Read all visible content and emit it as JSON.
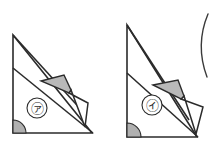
{
  "figure": {
    "background_color": "#ffffff",
    "stroke_color": "#2b2b2b",
    "shade_color": "#b9b9b9",
    "angle_mark_color": "#b0b0b0",
    "width": 212,
    "height": 144,
    "panels": [
      {
        "id": "panel-a",
        "label": "㋐",
        "label_position": {
          "x": 37,
          "y": 108
        },
        "label_radius": 10,
        "triangle": {
          "apex": {
            "x": 13,
            "y": 35
          },
          "bottom_left": {
            "x": 13,
            "y": 133
          },
          "bottom_right": {
            "x": 92,
            "y": 133
          }
        },
        "fold_crease": {
          "x1": 13,
          "y1": 68,
          "x2": 92,
          "y2": 133
        },
        "fold_lines": [
          {
            "x1": 13,
            "y1": 35,
            "x2": 86,
            "y2": 115
          },
          {
            "x1": 13,
            "y1": 68,
            "x2": 93,
            "y2": 133
          }
        ],
        "shaded_flap": [
          {
            "x": 41,
            "y": 81
          },
          {
            "x": 64,
            "y": 75
          },
          {
            "x": 71,
            "y": 90
          },
          {
            "x": 69,
            "y": 93
          }
        ],
        "white_flap": [
          {
            "x": 69,
            "y": 93
          },
          {
            "x": 88,
            "y": 103
          },
          {
            "x": 85,
            "y": 127
          },
          {
            "x": 71,
            "y": 90
          }
        ],
        "right_angle_marker": {
          "corner": {
            "x": 13,
            "y": 133
          },
          "radius": 13
        }
      },
      {
        "id": "panel-b",
        "label": "㋑",
        "label_position": {
          "x": 152,
          "y": 105
        },
        "label_radius": 10,
        "triangle": {
          "apex": {
            "x": 127,
            "y": 25
          },
          "bottom_left": {
            "x": 127,
            "y": 137
          },
          "bottom_right": {
            "x": 197,
            "y": 137
          }
        },
        "fold_crease": {
          "x1": 127,
          "y1": 73,
          "x2": 197,
          "y2": 137
        },
        "fold_lines": [
          {
            "x1": 127,
            "y1": 25,
            "x2": 189,
            "y2": 120
          },
          {
            "x1": 127,
            "y1": 73,
            "x2": 198,
            "y2": 137
          }
        ],
        "shaded_flap": [
          {
            "x": 153,
            "y": 85
          },
          {
            "x": 178,
            "y": 80
          },
          {
            "x": 184,
            "y": 96
          },
          {
            "x": 181,
            "y": 99
          }
        ],
        "white_flap": [
          {
            "x": 181,
            "y": 99
          },
          {
            "x": 203,
            "y": 107
          },
          {
            "x": 196,
            "y": 134
          },
          {
            "x": 184,
            "y": 96
          }
        ],
        "right_angle_marker": {
          "corner": {
            "x": 127,
            "y": 137
          },
          "radius": 14
        }
      }
    ],
    "edge_arc": {
      "id": "right-edge-arc",
      "description": "partial circle cropped at right margin",
      "path": "M 208 14 Q 195 45 207 77"
    }
  }
}
